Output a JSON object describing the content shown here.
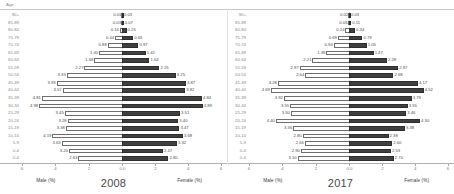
{
  "chart_data": {
    "type": "bar",
    "chart_style": "population-pyramid",
    "title": "",
    "axis_header": "Age",
    "categories": [
      "90+",
      "85-89",
      "80-84",
      "75-79",
      "70-74",
      "65-69",
      "60-64",
      "55-59",
      "50-54",
      "45-49",
      "40-44",
      "35-39",
      "30-34",
      "25-29",
      "20-24",
      "15-19",
      "10-14",
      "5-9",
      "0-4"
    ],
    "xlabel_left": "Male (%)",
    "xlabel_right": "Female (%)",
    "ylabel": "Age",
    "xlim": [
      -6,
      6
    ],
    "xticks": [
      "6",
      "4",
      "2",
      "0.0",
      "2",
      "4",
      "6"
    ],
    "xtick_values": [
      -6,
      -4,
      -2,
      0,
      2,
      4,
      6
    ],
    "grid": false,
    "legend": "none",
    "colors": {
      "male": "#fdfdfd",
      "male_edge": "#6d6d6d",
      "female": "#3f3f3f",
      "female_edge": "#2e2e2e"
    },
    "panels": [
      {
        "title": "2008",
        "series": [
          {
            "name": "Male (%)",
            "values": [
              0.01,
              0.03,
              0.16,
              0.44,
              0.88,
              1.4,
              1.68,
              2.27,
              3.33,
              3.93,
              3.57,
              4.81,
              4.98,
              3.45,
              3.28,
              3.38,
              4.19,
              3.63,
              3.2,
              2.63
            ]
          },
          {
            "name": "Female (%)",
            "values": [
              0.03,
              0.07,
              0.25,
              0.65,
              0.97,
              1.42,
              1.64,
              2.25,
              3.25,
              3.87,
              3.82,
              4.84,
              4.89,
              3.51,
              3.4,
              3.47,
              3.68,
              3.32,
              2.47,
              2.8
            ]
          }
        ]
      },
      {
        "title": "2017",
        "series": [
          {
            "name": "Male (%)",
            "values": [
              0.02,
              0.06,
              0.24,
              0.69,
              0.94,
              1.38,
              2.21,
              2.97,
              2.64,
              4.28,
              4.69,
              3.92,
              3.55,
              3.5,
              4.4,
              3.36,
              2.8,
              2.66,
              2.9,
              3.1
            ]
          },
          {
            "name": "Female (%)",
            "values": [
              0.03,
              0.11,
              0.34,
              0.79,
              1.05,
              1.47,
              2.28,
              2.97,
              2.68,
              4.17,
              4.52,
              3.79,
              3.55,
              3.46,
              4.3,
              3.38,
              2.38,
              2.6,
              2.53,
              2.7
            ]
          }
        ]
      }
    ],
    "rows_2008": [
      {
        "age": "90+",
        "male": 0.01,
        "female": 0.03
      },
      {
        "age": "85-89",
        "male": 0.03,
        "female": 0.07
      },
      {
        "age": "80-84",
        "male": 0.16,
        "female": 0.25
      },
      {
        "age": "75-79",
        "male": 0.44,
        "female": 0.65
      },
      {
        "age": "70-74",
        "male": 0.88,
        "female": 0.97
      },
      {
        "age": "65-69",
        "male": 1.4,
        "female": 1.42
      },
      {
        "age": "60-64",
        "male": 1.68,
        "female": 1.64
      },
      {
        "age": "55-59",
        "male": 2.27,
        "female": 2.25
      },
      {
        "age": "50-54",
        "male": 3.33,
        "female": 3.25
      },
      {
        "age": "45-49",
        "male": 3.93,
        "female": 3.87
      },
      {
        "age": "40-44",
        "male": 3.57,
        "female": 3.82
      },
      {
        "age": "35-39",
        "male": 4.81,
        "female": 4.84
      },
      {
        "age": "30-34",
        "male": 4.98,
        "female": 4.89
      },
      {
        "age": "25-29",
        "male": 3.45,
        "female": 3.51
      },
      {
        "age": "20-24",
        "male": 3.28,
        "female": 3.4
      },
      {
        "age": "15-19",
        "male": 3.38,
        "female": 3.47
      },
      {
        "age": "10-14",
        "male": 4.19,
        "female": 3.68
      },
      {
        "age": "5-9",
        "male": 3.63,
        "female": 3.32
      },
      {
        "age": "0-4",
        "male": 3.2,
        "female": 2.47
      },
      {
        "age": "0-4b",
        "male": 2.63,
        "female": 2.8
      }
    ],
    "rows_2017": [
      {
        "age": "90+",
        "male": 0.02,
        "female": 0.03
      },
      {
        "age": "85-89",
        "male": 0.06,
        "female": 0.11
      },
      {
        "age": "80-84",
        "male": 0.24,
        "female": 0.34
      },
      {
        "age": "75-79",
        "male": 0.69,
        "female": 0.79
      },
      {
        "age": "70-74",
        "male": 0.94,
        "female": 1.05
      },
      {
        "age": "65-69",
        "male": 1.38,
        "female": 1.47
      },
      {
        "age": "60-64",
        "male": 2.21,
        "female": 2.28
      },
      {
        "age": "55-59",
        "male": 2.97,
        "female": 2.97
      },
      {
        "age": "50-54",
        "male": 2.64,
        "female": 2.68
      },
      {
        "age": "45-49",
        "male": 4.28,
        "female": 4.17
      },
      {
        "age": "40-44",
        "male": 4.69,
        "female": 4.52
      },
      {
        "age": "35-39",
        "male": 3.92,
        "female": 3.79
      },
      {
        "age": "30-34",
        "male": 3.55,
        "female": 3.55
      },
      {
        "age": "25-29",
        "male": 3.5,
        "female": 3.46
      },
      {
        "age": "20-24",
        "male": 4.4,
        "female": 4.3
      },
      {
        "age": "15-19",
        "male": 3.36,
        "female": 3.38
      },
      {
        "age": "10-14",
        "male": 2.8,
        "female": 2.38
      },
      {
        "age": "5-9",
        "male": 2.66,
        "female": 2.6
      },
      {
        "age": "0-4",
        "male": 2.9,
        "female": 2.53
      },
      {
        "age": "0-4b",
        "male": 3.1,
        "female": 2.7
      }
    ]
  }
}
